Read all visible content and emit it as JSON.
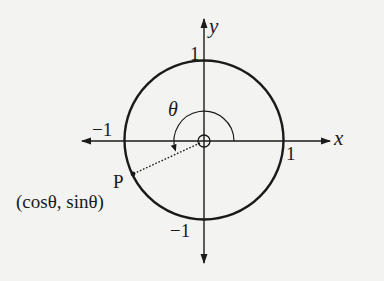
{
  "diagram": {
    "axes": {
      "x_label": "x",
      "y_label": "y",
      "ticks": {
        "top": "1",
        "right": "1",
        "left": "−1",
        "bottom": "−1"
      }
    },
    "angle_label": "θ",
    "point": {
      "name": "P",
      "coordinates": "(cosθ, sinθ)"
    },
    "colors": {
      "background": "#f3f3f2",
      "ink": "#1a1a1a"
    }
  }
}
